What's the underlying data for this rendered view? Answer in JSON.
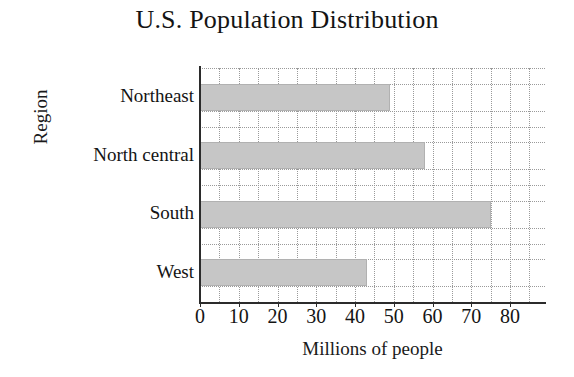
{
  "chart_data": {
    "type": "bar",
    "orientation": "horizontal",
    "title": "U.S. Population Distribution",
    "xlabel": "Millions of people",
    "ylabel": "Region",
    "categories": [
      "Northeast",
      "North central",
      "South",
      "West"
    ],
    "values": [
      49,
      58,
      75,
      43
    ],
    "unit": "millions of people",
    "xlim": [
      0,
      89
    ],
    "xticks": [
      0,
      10,
      20,
      30,
      40,
      50,
      60,
      70,
      80
    ],
    "xticklabels": [
      "0",
      "10",
      "20",
      "30",
      "40",
      "50",
      "60",
      "70",
      "80"
    ],
    "grid": {
      "vertical": true,
      "horizontal": true,
      "style": "dotted",
      "vertical_step": 5,
      "color": "#9a9a9a"
    },
    "legend": null,
    "bar_color": "#c6c6c6",
    "axis_color": "#2b2b2b",
    "text_color": "#141414",
    "background": "#ffffff"
  }
}
